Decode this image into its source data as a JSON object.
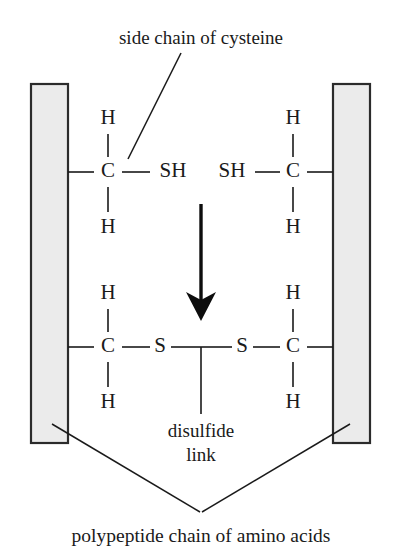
{
  "diagram": {
    "title_annotation": "side chain of cysteine",
    "bottom_caption": "polypeptide chain of amino acids",
    "disulfide_label_line1": "disulfide",
    "disulfide_label_line2": "link",
    "colors": {
      "chain_bar_fill": "#ebebeb",
      "chain_bar_stroke": "#2b2b2b",
      "ink": "#1a1a1a",
      "arrow": "#0d0d0d",
      "background": "#ffffff"
    },
    "top_reaction": {
      "left_group": {
        "h_top": "H",
        "carbon": "C",
        "h_bottom": "H",
        "thiol": "SH"
      },
      "right_group": {
        "h_top": "H",
        "carbon": "C",
        "h_bottom": "H",
        "thiol": "SH"
      }
    },
    "bottom_reaction": {
      "left_group": {
        "h_top": "H",
        "carbon": "C",
        "h_bottom": "H",
        "sulfur": "S"
      },
      "right_group": {
        "h_top": "H",
        "carbon": "C",
        "h_bottom": "H",
        "sulfur": "S"
      }
    }
  }
}
